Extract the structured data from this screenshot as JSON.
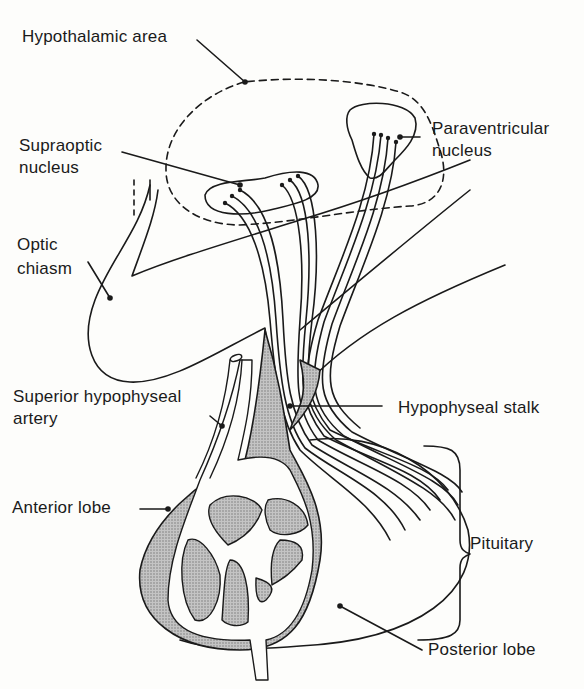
{
  "diagram": {
    "labels": {
      "hypothalamic_area": "Hypothalamic area",
      "supraoptic_1": "Supraoptic",
      "supraoptic_2": "nucleus",
      "paraventricular_1": "Paraventricular",
      "paraventricular_2": "nucleus",
      "optic_1": "Optic",
      "optic_2": "chiasm",
      "sup_artery_1": "Superior hypophyseal",
      "sup_artery_2": "artery",
      "stalk": "Hypophyseal stalk",
      "anterior": "Anterior lobe",
      "pituitary": "Pituitary",
      "posterior": "Posterior lobe"
    },
    "colors": {
      "line": "#1a1a1a",
      "shading": "#a8a8a8",
      "background": "#fdfdfb"
    }
  }
}
